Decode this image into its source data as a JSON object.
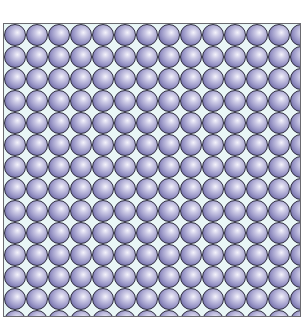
{
  "image": {
    "subject": "square lattice of close-packed spheres",
    "columns": 14,
    "rows": 14,
    "sphere_diameter_px": 22,
    "colors": {
      "sphere_highlight": "#f4f3fb",
      "sphere_mid": "#9b98c8",
      "sphere_shadow": "#54507f",
      "gap_background": "#e9f6f6",
      "frame_border": "#6b6b70"
    }
  }
}
